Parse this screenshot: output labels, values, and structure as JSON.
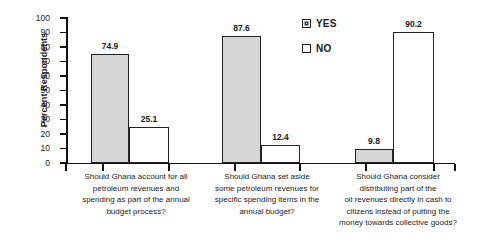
{
  "chart_data": {
    "type": "bar",
    "title": "",
    "xlabel": "",
    "ylabel": "Percent Respondents",
    "ylim": [
      0,
      100
    ],
    "ytick_values": [
      0,
      10,
      20,
      30,
      40,
      50,
      60,
      70,
      80,
      90,
      100
    ],
    "ytick_labels": [
      "0",
      "10",
      "20",
      "30",
      "40",
      "50",
      "60",
      "70",
      "80",
      "90",
      "100"
    ],
    "grid": false,
    "legend_position": "inside top-right",
    "categories": [
      "Should Ghana account for all petroleum revenues and spending as part of the annual budget process?",
      "Should Ghana set aside some petroleum revenues for specific spending items in the annual budget?",
      "Should Ghana consider distributing part of the oil revenues directly in cash to citizens instead of putting the money towards collective goods?"
    ],
    "category_lines": [
      [
        "Should Ghana account for all",
        "petroleum revenues and",
        "spending as part of the annual",
        "budget process?"
      ],
      [
        "Should Ghana set aside",
        "some petroleum revenues for",
        "specific spending items in the",
        "annual budget?"
      ],
      [
        "Should Ghana consider",
        "distributing part of the",
        "oil revenues directly in cash to",
        "citizens instead of putting the",
        "money towards collective goods?"
      ]
    ],
    "series": [
      {
        "name": "YES",
        "values": [
          74.9,
          87.6,
          9.8
        ],
        "labels": [
          "74.9",
          "87.6",
          "9.8"
        ],
        "color": "#d6d6d6"
      },
      {
        "name": "NO",
        "values": [
          25.1,
          12.4,
          90.2
        ],
        "labels": [
          "25.1",
          "12.4",
          "90.2"
        ],
        "color": "#ffffff"
      }
    ]
  },
  "legend": {
    "items": [
      {
        "label": "YES",
        "marker": "filled-square"
      },
      {
        "label": "NO",
        "marker": "empty-square"
      }
    ]
  }
}
